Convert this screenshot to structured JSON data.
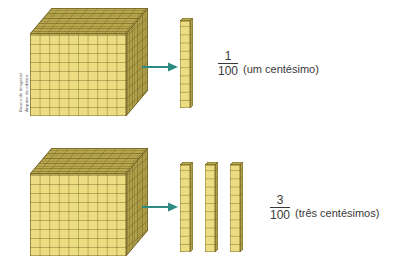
{
  "credit": {
    "text": "Banco de imagens/\nArquivo da editora"
  },
  "colors": {
    "face_front": "#ecdc82",
    "face_front_line": "#7a6a28",
    "face_top": "#b9a84e",
    "face_top_line": "#6d5f22",
    "face_side": "#b0a04a",
    "face_side_line": "#6d5f22",
    "arrow": "#2e8b84",
    "text": "#3a3a3a",
    "background": "#ffffff"
  },
  "rows": [
    {
      "id": "row-one-hundredth",
      "cube": {
        "label": "base-ten-cube",
        "units_per_edge": 10,
        "total_units": 1000
      },
      "rods": {
        "count": 1,
        "units_per_rod": 10
      },
      "arrow": {
        "direction": "right"
      },
      "fraction": {
        "numerator": "1",
        "denominator": "100"
      },
      "caption": "(um centésimo)"
    },
    {
      "id": "row-three-hundredths",
      "cube": {
        "label": "base-ten-cube",
        "units_per_edge": 10,
        "total_units": 1000
      },
      "rods": {
        "count": 3,
        "units_per_rod": 10
      },
      "arrow": {
        "direction": "right"
      },
      "fraction": {
        "numerator": "3",
        "denominator": "100"
      },
      "caption": "(três centésimos)"
    }
  ]
}
